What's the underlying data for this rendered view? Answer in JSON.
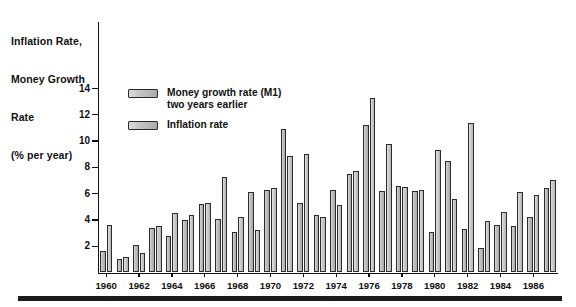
{
  "axis_title": {
    "line1": "Inflation Rate,",
    "line2": "Money Growth",
    "line3": "Rate",
    "line4": "(% per year)"
  },
  "legend": {
    "items": [
      {
        "label_line1": "Money growth rate (M1)",
        "label_line2": "two years earlier",
        "color": "#c2c2c2"
      },
      {
        "label_line1": "Inflation rate",
        "label_line2": "",
        "color": "#cccccc"
      }
    ]
  },
  "chart_data": {
    "type": "bar",
    "title": "",
    "subtitle": "",
    "xlabel": "",
    "ylabel": "Inflation Rate, Money Growth Rate (% per year)",
    "ylim": [
      0,
      15
    ],
    "yticks": [
      2,
      4,
      6,
      8,
      10,
      12,
      14
    ],
    "ytick_labels": [
      "2",
      "4",
      "6",
      "8",
      "10",
      "12",
      "14"
    ],
    "grid": false,
    "legend_position": "upper-left-inside",
    "categories": [
      "1960",
      "1961",
      "1962",
      "1963",
      "1964",
      "1965",
      "1966",
      "1967",
      "1968",
      "1969",
      "1970",
      "1971",
      "1972",
      "1973",
      "1974",
      "1975",
      "1976",
      "1977",
      "1978",
      "1979",
      "1980",
      "1981",
      "1982",
      "1983",
      "1984",
      "1985",
      "1986",
      "1987"
    ],
    "xtick_labels": [
      "1960",
      "1962",
      "1964",
      "1966",
      "1968",
      "1970",
      "1972",
      "1974",
      "1976",
      "1978",
      "1980",
      "1982",
      "1984",
      "1986"
    ],
    "series": [
      {
        "name": "Money growth rate (M1) two years earlier",
        "values": [
          1.6,
          1.0,
          2.1,
          3.4,
          2.8,
          4.0,
          5.2,
          4.1,
          3.1,
          6.1,
          6.3,
          10.9,
          5.3,
          4.4,
          6.3,
          7.5,
          11.2,
          6.2,
          6.6,
          6.2,
          3.1,
          8.5,
          3.3,
          1.9,
          3.6,
          3.5,
          4.2,
          6.4
        ]
      },
      {
        "name": "Inflation rate",
        "values": [
          3.6,
          1.2,
          1.5,
          3.5,
          4.5,
          4.4,
          5.3,
          7.3,
          4.2,
          3.2,
          6.4,
          8.9,
          9.0,
          4.2,
          5.1,
          7.7,
          13.3,
          9.8,
          6.5,
          6.3,
          9.3,
          5.6,
          11.4,
          3.9,
          4.6,
          6.1,
          5.9,
          7.0
        ]
      }
    ],
    "note": "paired bars; money-growth bar drawn left of inflation bar within each year slot"
  }
}
